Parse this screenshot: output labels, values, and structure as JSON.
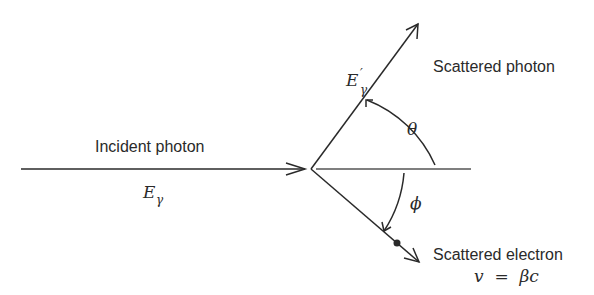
{
  "figure": {
    "type": "Compton scattering diagram",
    "incident": {
      "label": "Incident photon",
      "energy_symbol": "E",
      "energy_subscript": "γ"
    },
    "scattered_photon": {
      "label": "Scattered photon",
      "energy_symbol": "E",
      "energy_subscript": "γ",
      "energy_prime": "′"
    },
    "scattered_electron": {
      "label": "Scattered electron",
      "velocity": "v  =  βc"
    },
    "angles": {
      "photon_angle": "θ",
      "electron_angle": "ϕ"
    },
    "colors": {
      "ink": "#2a2a2a",
      "background": "#ffffff"
    }
  }
}
